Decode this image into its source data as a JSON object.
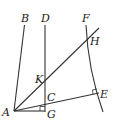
{
  "diagram": {
    "type": "geometry",
    "points": {
      "A": {
        "label": "A",
        "x": 14,
        "y": 110
      },
      "B": {
        "label": "B",
        "x": 24,
        "y": 25
      },
      "D": {
        "label": "D",
        "x": 45,
        "y": 25
      },
      "F": {
        "label": "F",
        "x": 86,
        "y": 25
      },
      "H": {
        "label": "H",
        "x": 88,
        "y": 40
      },
      "K": {
        "label": "K",
        "x": 45,
        "y": 79
      },
      "C": {
        "label": "C",
        "x": 45,
        "y": 103
      },
      "E": {
        "label": "E",
        "x": 96,
        "y": 94
      },
      "G": {
        "label": "G",
        "x": 45,
        "y": 112
      }
    },
    "labels": {
      "A": "A",
      "B": "B",
      "C": "C",
      "D": "D",
      "E": "E",
      "F": "F",
      "G": "G",
      "H": "H",
      "K": "K"
    },
    "right_angles": [
      "G",
      "E"
    ],
    "stroke_color": "#333333",
    "background": "#ffffff"
  }
}
